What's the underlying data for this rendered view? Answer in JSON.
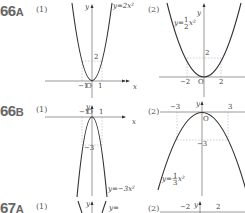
{
  "problems": [
    {
      "id": "66A",
      "number": "66",
      "letter": "A",
      "parts": [
        {
          "label": "(1)",
          "equation": "y=2x²",
          "ticks_x": [
            "-1",
            "1"
          ],
          "ticks_y": [
            "2"
          ],
          "origin": "O"
        },
        {
          "label": "(2)",
          "equation": "y=1/2 x²",
          "ticks_x": [
            "-2",
            "2"
          ],
          "ticks_y": [
            "2"
          ],
          "origin": "O"
        }
      ]
    },
    {
      "id": "66B",
      "number": "66",
      "letter": "B",
      "parts": [
        {
          "label": "(1)",
          "equation": "y=-3x²",
          "ticks_x": [
            "-1",
            "1"
          ],
          "ticks_y": [
            "-3"
          ],
          "origin": "O"
        },
        {
          "label": "(2)",
          "equation": "y=-1/3 x²",
          "ticks_x": [
            "-3",
            "3"
          ],
          "ticks_y": [
            "-3"
          ],
          "origin": "O"
        }
      ]
    },
    {
      "id": "67A",
      "number": "67",
      "letter": "A",
      "parts": [
        {
          "label": "(1)"
        },
        {
          "label": "(2)",
          "ticks_x": [
            "-2",
            "2"
          ]
        }
      ]
    }
  ],
  "axis": {
    "x": "x",
    "y": "y"
  }
}
